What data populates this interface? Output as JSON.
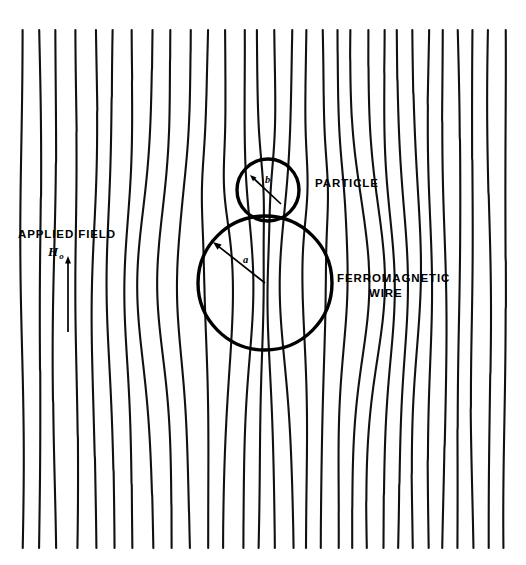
{
  "figure": {
    "name": "magnetic-field-lines-around-ferromagnetic-wire",
    "background": "#ffffff",
    "ink": "#000000"
  },
  "labels": {
    "applied_field": "APPLIED FIELD",
    "field_symbol": "H",
    "field_subscript": "o",
    "particle": "PARTICLE",
    "wire_line1": "FERROMAGNETIC",
    "wire_line2": "WIRE",
    "radius_wire": "a",
    "radius_particle": "b"
  },
  "chart_data": {
    "type": "line",
    "xlabel": "",
    "ylabel": "",
    "xlim": [
      0,
      526
    ],
    "ylim": [
      0,
      565
    ],
    "grid": false,
    "legend_position": "none",
    "annotations": [
      {
        "text": "APPLIED FIELD",
        "x": 18,
        "y": 238
      },
      {
        "text": "Ho",
        "x": 48,
        "y": 255
      },
      {
        "text": "PARTICLE",
        "x": 315,
        "y": 187
      },
      {
        "text": "FERROMAGNETIC",
        "x": 337,
        "y": 282
      },
      {
        "text": "WIRE",
        "x": 370,
        "y": 297
      },
      {
        "text": "a",
        "x": 243,
        "y": 262
      },
      {
        "text": "b",
        "x": 266,
        "y": 182
      }
    ],
    "shapes": [
      {
        "kind": "circle",
        "name": "ferromagnetic-wire",
        "cx": 265,
        "cy": 283,
        "r": 67
      },
      {
        "kind": "circle",
        "name": "particle",
        "cx": 268,
        "cy": 190,
        "r": 31
      },
      {
        "kind": "arrow",
        "name": "applied-field-direction",
        "x1": 68,
        "y1": 332,
        "x2": 68,
        "y2": 256
      },
      {
        "kind": "arrow",
        "name": "radius-a-leader",
        "x1": 265,
        "y1": 283,
        "x2": 213,
        "y2": 242
      },
      {
        "kind": "arrow",
        "name": "radius-b-leader",
        "x1": 281,
        "y1": 204,
        "x2": 250,
        "y2": 175
      }
    ],
    "series_description": "30 vertical magnetic flux lines, uniform and straight far from the wire, converging toward the wire axis and bulging away on the flanks near the ferromagnetic sphere",
    "line_count": 30,
    "x_top_positions": [
      22,
      40,
      55,
      77,
      96,
      113,
      133,
      152,
      172,
      190,
      208,
      225,
      243,
      258,
      275,
      292,
      307,
      322,
      337,
      352,
      368,
      383,
      398,
      413,
      428,
      443,
      458,
      472,
      489,
      505
    ],
    "y_top": 30,
    "y_bottom": 548
  }
}
